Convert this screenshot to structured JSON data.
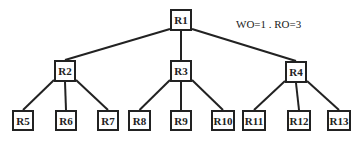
{
  "caption": "WO=1 . RO=3",
  "nodes": [
    {
      "id": "R1",
      "label": "R1",
      "x": 170,
      "y": 9,
      "w": 22,
      "h": 22
    },
    {
      "id": "R2",
      "label": "R2",
      "x": 54,
      "y": 60,
      "w": 22,
      "h": 22
    },
    {
      "id": "R3",
      "label": "R3",
      "x": 170,
      "y": 60,
      "w": 22,
      "h": 22
    },
    {
      "id": "R4",
      "label": "R4",
      "x": 285,
      "y": 61,
      "w": 22,
      "h": 22
    },
    {
      "id": "R5",
      "label": "R5",
      "x": 12,
      "y": 110,
      "w": 22,
      "h": 21
    },
    {
      "id": "R6",
      "label": "R6",
      "x": 55,
      "y": 110,
      "w": 22,
      "h": 21
    },
    {
      "id": "R7",
      "label": "R7",
      "x": 97,
      "y": 110,
      "w": 22,
      "h": 21
    },
    {
      "id": "R8",
      "label": "R8",
      "x": 128,
      "y": 110,
      "w": 23,
      "h": 21
    },
    {
      "id": "R9",
      "label": "R9",
      "x": 170,
      "y": 110,
      "w": 22,
      "h": 21
    },
    {
      "id": "R10",
      "label": "R10",
      "x": 211,
      "y": 110,
      "w": 24,
      "h": 21
    },
    {
      "id": "R11",
      "label": "R11",
      "x": 242,
      "y": 110,
      "w": 24,
      "h": 21
    },
    {
      "id": "R12",
      "label": "R12",
      "x": 287,
      "y": 110,
      "w": 24,
      "h": 21
    },
    {
      "id": "R13",
      "label": "R13",
      "x": 327,
      "y": 110,
      "w": 24,
      "h": 21
    }
  ],
  "edges": [
    [
      "R1",
      "R2"
    ],
    [
      "R1",
      "R3"
    ],
    [
      "R1",
      "R4"
    ],
    [
      "R2",
      "R5"
    ],
    [
      "R2",
      "R6"
    ],
    [
      "R2",
      "R7"
    ],
    [
      "R3",
      "R8"
    ],
    [
      "R3",
      "R9"
    ],
    [
      "R3",
      "R10"
    ],
    [
      "R4",
      "R11"
    ],
    [
      "R4",
      "R12"
    ],
    [
      "R4",
      "R13"
    ]
  ]
}
